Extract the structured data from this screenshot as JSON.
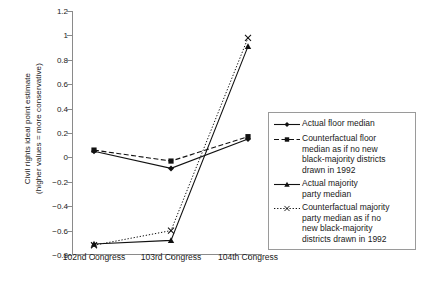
{
  "chart_data": {
    "type": "line",
    "title": "",
    "xlabel": "",
    "ylabel": "Civil rights ideal point estimate\n(higher values = more conservative)",
    "categories": [
      "102nd Congress",
      "103rd Congress",
      "104th Congress"
    ],
    "ylim": [
      -0.8,
      1.2
    ],
    "ytick_labels": [
      "1.2",
      "1",
      "0.8",
      "0.6",
      "0.4",
      "0.2",
      "0",
      "−0.2",
      "−0.4",
      "−0.6",
      "−0.8"
    ],
    "ytick_values": [
      1.2,
      1.0,
      0.8,
      0.6,
      0.4,
      0.2,
      0.0,
      -0.2,
      -0.4,
      -0.6,
      -0.8
    ],
    "grid": false,
    "legend_position": "right",
    "series": [
      {
        "name": "Actual floor median",
        "marker": "diamond",
        "line": "solid",
        "values": [
          0.05,
          -0.09,
          0.15
        ]
      },
      {
        "name": "Counterfactual floor median as if no new black-majority districts drawn in 1992",
        "marker": "square",
        "line": "dashed",
        "values": [
          0.06,
          -0.03,
          0.17
        ]
      },
      {
        "name": "Actual majority party median",
        "marker": "triangle",
        "line": "solid",
        "values": [
          -0.71,
          -0.68,
          0.91
        ]
      },
      {
        "name": "Counterfactual majority party median as if no new black-majority districts drawn in 1992",
        "marker": "cross",
        "line": "dotted",
        "values": [
          -0.72,
          -0.6,
          0.98
        ]
      }
    ]
  },
  "legend": {
    "items": [
      {
        "label": "Actual floor median",
        "marker": "diamond-marker",
        "line_style": "solid"
      },
      {
        "label": "Counterfactual floor\nmedian as if no new\nblack-majority districts\ndrawn in 1992",
        "marker": "square-marker",
        "line_style": "dashed"
      },
      {
        "label": "Actual majority\nparty median",
        "marker": "triangle-marker",
        "line_style": "solid"
      },
      {
        "label": "Counterfactual majority\nparty median as if no\nnew black-majority\ndistricts drawn in 1992",
        "marker": "cross-marker",
        "line_style": "dotted"
      }
    ]
  },
  "colors": {
    "ink": "#1a1a1a",
    "axis": "#8a8a8a",
    "background": "#ffffff"
  }
}
